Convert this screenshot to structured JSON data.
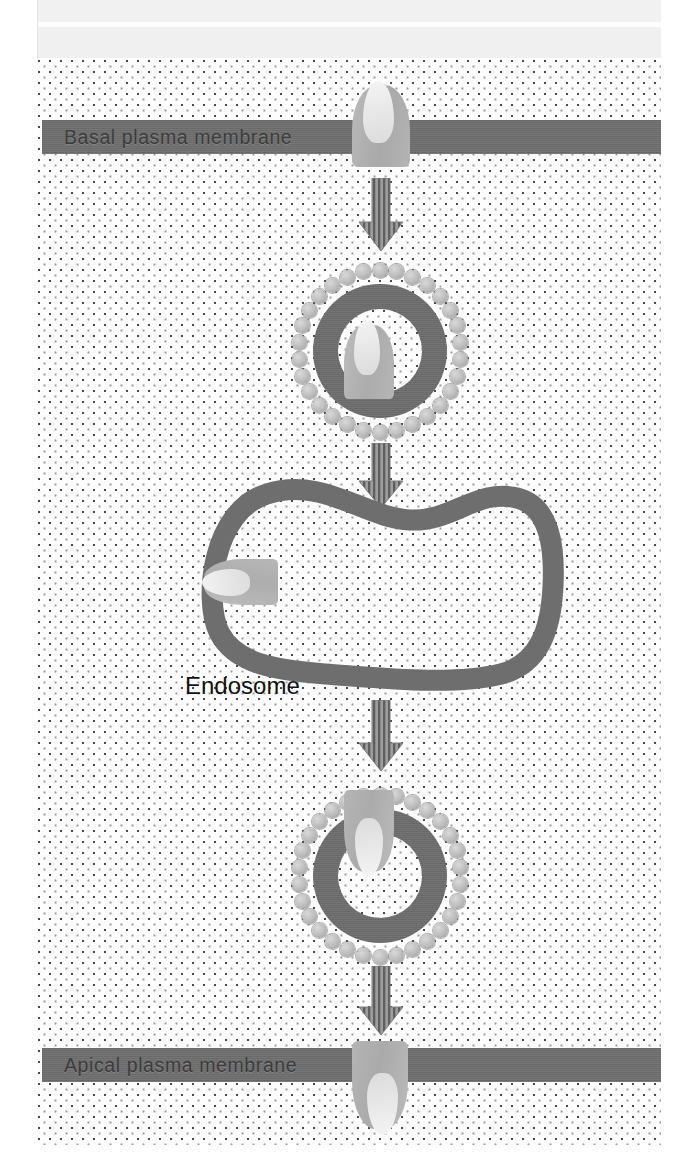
{
  "figure": {
    "background_color": "#fdfdfd",
    "membrane_color": "#6f6f6f",
    "receptor_color": "#b4b4b4",
    "ligand_color": "#e8e8e8",
    "arrow_color": "#7a7a7a",
    "label_text_color": "#121212"
  },
  "labels": {
    "basal_membrane": "Basal plasma membrane",
    "apical_membrane": "Apical plasma membrane",
    "endosome": "Endosome"
  },
  "structures": [
    {
      "id": "receptor-basal",
      "name": "receptor-ligand-complex",
      "stage": "bound at basal plasma membrane"
    },
    {
      "id": "vesicle-1",
      "name": "clathrin-coated-vesicle",
      "stage": "endocytic vesicle"
    },
    {
      "id": "endosome",
      "name": "endosome",
      "stage": "sorting endosome"
    },
    {
      "id": "vesicle-2",
      "name": "clathrin-coated-vesicle",
      "stage": "transcytotic vesicle"
    },
    {
      "id": "receptor-apical",
      "name": "receptor-ligand-complex",
      "stage": "released at apical plasma membrane"
    }
  ],
  "arrows": [
    {
      "id": "arrow-1",
      "direction": "down",
      "from": "basal plasma membrane",
      "to": "coated vesicle"
    },
    {
      "id": "arrow-2",
      "direction": "down",
      "from": "coated vesicle",
      "to": "endosome"
    },
    {
      "id": "arrow-3",
      "direction": "down",
      "from": "endosome",
      "to": "coated vesicle"
    },
    {
      "id": "arrow-4",
      "direction": "down",
      "from": "coated vesicle",
      "to": "apical plasma membrane"
    }
  ]
}
